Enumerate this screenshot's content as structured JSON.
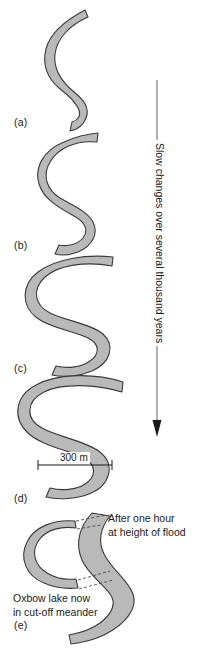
{
  "figure": {
    "background_color": "#ffffff",
    "river_fill_color": "#b9b9b9",
    "river_outline_color": "#3a3a3a"
  },
  "panels": [
    {
      "id": "a",
      "label": "(a)"
    },
    {
      "id": "b",
      "label": "(b)"
    },
    {
      "id": "c",
      "label": "(c)"
    },
    {
      "id": "d",
      "label": "(d)"
    },
    {
      "id": "e",
      "label": "(e)"
    }
  ],
  "timeline": {
    "label": "Slow changes over several thousand years",
    "direction": "downward",
    "arrow_color": "#1a1a1a"
  },
  "scale": {
    "label": "300 m",
    "value": 300,
    "unit": "m"
  },
  "annotations": {
    "flood": {
      "line1": "After one hour",
      "line2": "at height of flood"
    },
    "oxbow": {
      "line1": "Oxbow lake now",
      "line2": "in cut-off meander"
    }
  }
}
